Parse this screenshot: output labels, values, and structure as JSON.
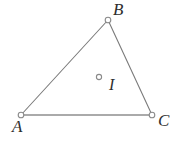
{
  "figure": {
    "canvas": {
      "width": 178,
      "height": 145,
      "background": "#ffffff"
    },
    "style": {
      "line_color": "#7b7b7b",
      "base_line_color": "#8f8f8f",
      "marker_stroke": "#8a8a8a",
      "marker_fill": "#ffffff",
      "label_color": "#2e2e2e"
    },
    "points": [
      {
        "id": "A",
        "label": "A",
        "x": 21,
        "y": 115,
        "kind": "vertex",
        "marker": "open-circle"
      },
      {
        "id": "B",
        "label": "B",
        "x": 108,
        "y": 20,
        "kind": "vertex",
        "marker": "open-circle"
      },
      {
        "id": "C",
        "label": "C",
        "x": 152,
        "y": 115,
        "kind": "vertex",
        "marker": "open-circle"
      },
      {
        "id": "I",
        "label": "I",
        "x": 99,
        "y": 77,
        "kind": "interior",
        "marker": "open-circle"
      }
    ],
    "edges": [
      {
        "id": "AB",
        "from": "A",
        "to": "B"
      },
      {
        "id": "BC",
        "from": "B",
        "to": "C"
      },
      {
        "id": "AC",
        "from": "A",
        "to": "C"
      }
    ]
  }
}
